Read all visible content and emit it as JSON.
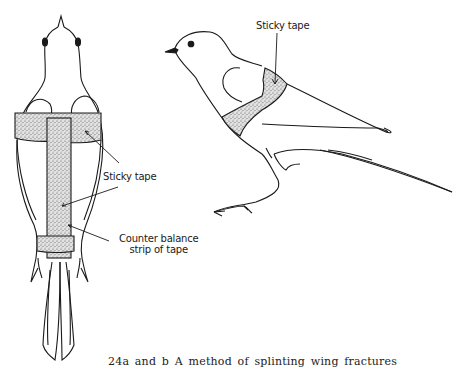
{
  "figure": {
    "caption": "24a and b A method of splinting wing fractures",
    "panel_a": {
      "description": "Bird seen from above with wing splinted by sticky tape",
      "labels": {
        "sticky_tape": "Sticky tape",
        "counter_balance_line1": "Counter balance",
        "counter_balance_line2": "strip of tape"
      }
    },
    "panel_b": {
      "description": "Bird seen from the side with band of sticky tape around body",
      "labels": {
        "sticky_tape": "Sticky tape"
      }
    },
    "colors": {
      "ink": "#1a1a1a",
      "tape_fill": "#cfcfcf",
      "background": "#ffffff"
    }
  }
}
